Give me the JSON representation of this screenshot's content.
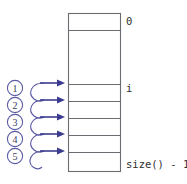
{
  "diagram": {
    "background_color": "#ffffff",
    "box": {
      "x": 68,
      "y": 13,
      "width": 53,
      "height": 159,
      "border_color": "#6b6b72",
      "fill_color": "#ffffff"
    },
    "cell_dividers_y": [
      30,
      84,
      101,
      118,
      135,
      152
    ],
    "index_labels": [
      {
        "text": "0",
        "y": 21,
        "name": "index-label-zero"
      },
      {
        "text": "i",
        "y": 88,
        "name": "index-label-i"
      },
      {
        "text": "size() - 1",
        "y": 164,
        "name": "index-label-size-minus-one"
      }
    ],
    "label_x": 126,
    "steps": [
      {
        "number": "1",
        "circle_cx": 15,
        "circle_cy": 88,
        "arrow_y": 83
      },
      {
        "number": "2",
        "circle_cx": 15,
        "circle_cy": 105,
        "arrow_y": 100
      },
      {
        "number": "3",
        "circle_cx": 15,
        "circle_cy": 122,
        "arrow_y": 117
      },
      {
        "number": "4",
        "circle_cx": 15,
        "circle_cy": 139,
        "arrow_y": 134
      },
      {
        "number": "5",
        "circle_cx": 15,
        "circle_cy": 156,
        "arrow_y": 151
      }
    ],
    "colors": {
      "arrow": "#3b3b8f",
      "curve": "#5b5ba6",
      "outline": "#6b6b72",
      "text": "#303030",
      "circle_text": "#3a3a5c"
    }
  }
}
